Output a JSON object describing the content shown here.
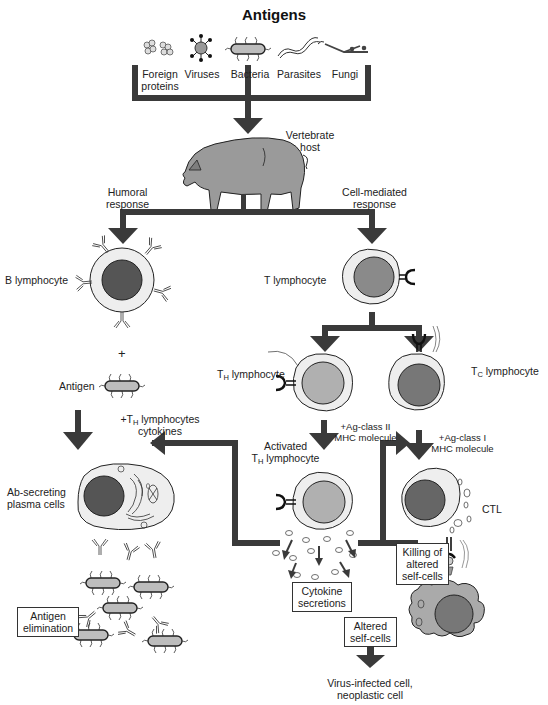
{
  "title": "Antigens",
  "antigens": [
    {
      "icon": "foreign-protein-icon",
      "line1": "Foreign",
      "line2": "proteins"
    },
    {
      "icon": "virus-icon",
      "line1": "Viruses",
      "line2": ""
    },
    {
      "icon": "bacterium-icon",
      "line1": "Bacteria",
      "line2": ""
    },
    {
      "icon": "parasite-icon",
      "line1": "Parasites",
      "line2": ""
    },
    {
      "icon": "fungus-icon",
      "line1": "Fungi",
      "line2": ""
    }
  ],
  "host": {
    "line1": "Vertebrate",
    "line2": "host"
  },
  "branches": {
    "humoral": {
      "line1": "Humoral",
      "line2": "response"
    },
    "cell_mediated": {
      "line1": "Cell-mediated",
      "line2": "response"
    }
  },
  "cells": {
    "b_lymphocyte": "B lymphocyte",
    "t_lymphocyte": "T lymphocyte",
    "th_prefix": "T",
    "th_sub": "H",
    "th_suffix": " lymphocyte",
    "tc_prefix": "T",
    "tc_sub": "C",
    "tc_suffix": " lymphocyte",
    "activated_line1": "Activated",
    "activated_prefix": "T",
    "activated_sub": "H",
    "activated_suffix": " lymphocyte",
    "plasma_line1": "Ab-secreting",
    "plasma_line2": "plasma cells",
    "ctl": "CTL"
  },
  "plus": "+",
  "antigen_label": "Antigen",
  "steps": {
    "th_help_prefix": "+T",
    "th_help_sub": "H",
    "th_help_suffix": " lymphocytes",
    "th_help_line2": "cytokines",
    "class2_line1": "+Ag-class II",
    "class2_line2": "MHC molecule",
    "class1_line1": "+Ag-class I",
    "class1_line2": "MHC molecule"
  },
  "boxes": {
    "antigen_elimination": {
      "line1": "Antigen",
      "line2": "elimination"
    },
    "cytokine_secretions": {
      "line1": "Cytokine",
      "line2": "secretions"
    },
    "killing": {
      "line1": "Killing of",
      "line2": "altered",
      "line3": "self-cells"
    },
    "altered_self": {
      "line1": "Altered",
      "line2": "self-cells"
    }
  },
  "outcome": {
    "line1": "Virus-infected cell,",
    "line2": "neoplastic cell"
  },
  "colors": {
    "arrow": "#3a3a3a",
    "nucleus_dark": "#555555",
    "nucleus_mid": "#8a8a8a",
    "nucleus_light": "#b0b0b0",
    "cytoplasm": "#eeeeee",
    "target_cell": "#aaaaaa"
  }
}
